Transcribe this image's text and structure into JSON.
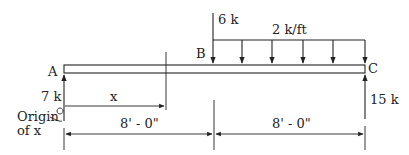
{
  "diagram": {
    "points": {
      "A": "A",
      "B": "B",
      "C": "C"
    },
    "loads": {
      "point_load_B": "6 k",
      "distributed_load": "2 k/ft"
    },
    "reactions": {
      "A": "7 k",
      "C": "15 k"
    },
    "section_variable": "x",
    "origin_label_line1": "Origin",
    "origin_label_line2": "of x",
    "dimensions": {
      "AB": "8' - 0\"",
      "BC": "8' - 0\""
    }
  }
}
